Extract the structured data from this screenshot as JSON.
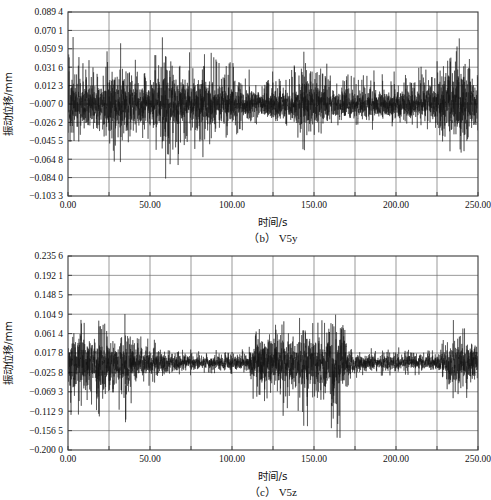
{
  "figure": {
    "name": "vibration-displacement-time-history",
    "panels": [
      {
        "id": "b",
        "caption": "(b) V5y",
        "ylabel": "振动位移/mm",
        "xlabel": "时间/s",
        "yticks": [
          "0.089 4",
          "0.070 1",
          "0.050 9",
          "0.031 6",
          "0.012 3",
          "-0.007 0",
          "-0.026 2",
          "-0.045 5",
          "-0.064 8",
          "-0.084 0",
          "-0.103 3"
        ],
        "xticks": [
          "0.00",
          "50.00",
          "100.00",
          "150.00",
          "200.00",
          "250.00"
        ]
      },
      {
        "id": "c",
        "caption": "(c) V5z",
        "ylabel": "振动位移/mm",
        "xlabel": "时间/s",
        "yticks": [
          "0.235 6",
          "0.192 1",
          "0.148 5",
          "0.104 9",
          "0.061 4",
          "0.017 8",
          "-0.025 8",
          "-0.069 3",
          "-0.112 9",
          "-0.156 5",
          "-0.200 0"
        ],
        "xticks": [
          "0.00",
          "50.00",
          "100.00",
          "150.00",
          "200.00",
          "250.00"
        ]
      }
    ]
  },
  "colors": {
    "trace": "#141414",
    "grid": "#6f6f6f",
    "frame": "#3a3a3a",
    "background": "#ffffff"
  },
  "chart_data": [
    {
      "type": "line",
      "id": "b",
      "title": "(b) V5y",
      "xlabel": "时间/s",
      "ylabel": "振动位移/mm",
      "xlim": [
        0.0,
        250.0
      ],
      "ylim": [
        -0.1033,
        0.0894
      ],
      "xticks": [
        0.0,
        50.0,
        100.0,
        150.0,
        200.0,
        250.0
      ],
      "xtick_labels": [
        "0.00",
        "50.00",
        "100.00",
        "150.00",
        "200.00",
        "250.00"
      ],
      "yticks": [
        0.0894,
        0.0701,
        0.0509,
        0.0316,
        0.0123,
        -0.007,
        -0.0262,
        -0.0455,
        -0.0648,
        -0.084,
        -0.1033
      ],
      "ytick_labels": [
        "0.089 4",
        "0.070 1",
        "0.050 9",
        "0.031 6",
        "0.012 3",
        "-0.007 0",
        "-0.026 2",
        "-0.045 5",
        "-0.064 8",
        "-0.084 0",
        "-0.103 3"
      ],
      "grid": true,
      "legend": null,
      "series": [
        {
          "name": "V5y",
          "description": "dense broadband vibration trace, mean near -0.007 mm, amplitude envelope varying with time",
          "envelope_x": [
            0,
            5,
            10,
            15,
            20,
            25,
            30,
            35,
            40,
            45,
            50,
            55,
            60,
            65,
            70,
            75,
            80,
            85,
            90,
            95,
            100,
            105,
            110,
            115,
            120,
            125,
            130,
            135,
            140,
            145,
            150,
            155,
            160,
            165,
            170,
            175,
            180,
            185,
            190,
            195,
            200,
            205,
            210,
            215,
            220,
            225,
            230,
            235,
            240,
            245,
            250
          ],
          "envelope_upper": [
            0.089,
            0.062,
            0.05,
            0.046,
            0.048,
            0.055,
            0.06,
            0.052,
            0.046,
            0.044,
            0.05,
            0.058,
            0.072,
            0.066,
            0.052,
            0.05,
            0.061,
            0.054,
            0.046,
            0.042,
            0.04,
            0.036,
            0.033,
            0.03,
            0.029,
            0.03,
            0.032,
            0.034,
            0.038,
            0.052,
            0.046,
            0.038,
            0.034,
            0.031,
            0.03,
            0.029,
            0.03,
            0.032,
            0.031,
            0.029,
            0.028,
            0.029,
            0.03,
            0.032,
            0.035,
            0.044,
            0.062,
            0.07,
            0.068,
            0.06,
            0.048
          ],
          "envelope_lower": [
            -0.05,
            -0.058,
            -0.048,
            -0.046,
            -0.052,
            -0.07,
            -0.078,
            -0.062,
            -0.048,
            -0.046,
            -0.05,
            -0.06,
            -0.098,
            -0.086,
            -0.056,
            -0.052,
            -0.08,
            -0.06,
            -0.048,
            -0.044,
            -0.042,
            -0.038,
            -0.035,
            -0.032,
            -0.031,
            -0.032,
            -0.034,
            -0.036,
            -0.042,
            -0.062,
            -0.05,
            -0.04,
            -0.036,
            -0.033,
            -0.032,
            -0.031,
            -0.032,
            -0.034,
            -0.033,
            -0.031,
            -0.03,
            -0.031,
            -0.032,
            -0.034,
            -0.038,
            -0.05,
            -0.08,
            -0.092,
            -0.086,
            -0.07,
            -0.052
          ]
        }
      ]
    },
    {
      "type": "line",
      "id": "c",
      "title": "(c) V5z",
      "xlabel": "时间/s",
      "ylabel": "振动位移/mm",
      "xlim": [
        0.0,
        250.0
      ],
      "ylim": [
        -0.2,
        0.2356
      ],
      "xticks": [
        0.0,
        50.0,
        100.0,
        150.0,
        200.0,
        250.0
      ],
      "xtick_labels": [
        "0.00",
        "50.00",
        "100.00",
        "150.00",
        "200.00",
        "250.00"
      ],
      "yticks": [
        0.2356,
        0.1921,
        0.1485,
        0.1049,
        0.0614,
        0.0178,
        -0.0258,
        -0.0693,
        -0.1129,
        -0.1565,
        -0.2
      ],
      "ytick_labels": [
        "0.235 6",
        "0.192 1",
        "0.148 5",
        "0.104 9",
        "0.061 4",
        "0.017 8",
        "-0.025 8",
        "-0.069 3",
        "-0.112 9",
        "-0.156 5",
        "-0.200 0"
      ],
      "grid": true,
      "legend": null,
      "series": [
        {
          "name": "V5z",
          "description": "burst-type vibration: strong activity 0-60 s, quiet 65-110 s, strong 112-165 s, quiet 170-230 s, burst near 235-250 s",
          "envelope_x": [
            0,
            5,
            10,
            15,
            20,
            25,
            30,
            35,
            40,
            45,
            50,
            55,
            60,
            65,
            70,
            75,
            80,
            85,
            90,
            95,
            100,
            105,
            110,
            115,
            120,
            125,
            130,
            135,
            140,
            145,
            150,
            155,
            160,
            165,
            170,
            175,
            180,
            185,
            190,
            195,
            200,
            205,
            210,
            215,
            220,
            225,
            230,
            235,
            240,
            245,
            250
          ],
          "envelope_upper": [
            0.1,
            0.118,
            0.104,
            0.092,
            0.1,
            0.086,
            0.078,
            0.11,
            0.072,
            0.058,
            0.052,
            0.044,
            0.042,
            0.038,
            0.034,
            0.03,
            0.028,
            0.026,
            0.028,
            0.03,
            0.028,
            0.026,
            0.028,
            0.112,
            0.09,
            0.082,
            0.096,
            0.104,
            0.09,
            0.118,
            0.098,
            0.102,
            0.16,
            0.236,
            0.064,
            0.036,
            0.032,
            0.03,
            0.032,
            0.034,
            0.032,
            0.03,
            0.032,
            0.03,
            0.028,
            0.03,
            0.06,
            0.102,
            0.086,
            0.07,
            0.048
          ],
          "envelope_lower": [
            -0.112,
            -0.15,
            -0.126,
            -0.11,
            -0.132,
            -0.118,
            -0.104,
            -0.146,
            -0.086,
            -0.066,
            -0.058,
            -0.048,
            -0.044,
            -0.04,
            -0.036,
            -0.032,
            -0.03,
            -0.028,
            -0.03,
            -0.032,
            -0.03,
            -0.028,
            -0.03,
            -0.14,
            -0.118,
            -0.106,
            -0.124,
            -0.138,
            -0.118,
            -0.158,
            -0.128,
            -0.134,
            -0.18,
            -0.196,
            -0.076,
            -0.04,
            -0.034,
            -0.032,
            -0.034,
            -0.036,
            -0.034,
            -0.032,
            -0.034,
            -0.032,
            -0.03,
            -0.032,
            -0.07,
            -0.132,
            -0.11,
            -0.086,
            -0.056
          ]
        }
      ]
    }
  ]
}
